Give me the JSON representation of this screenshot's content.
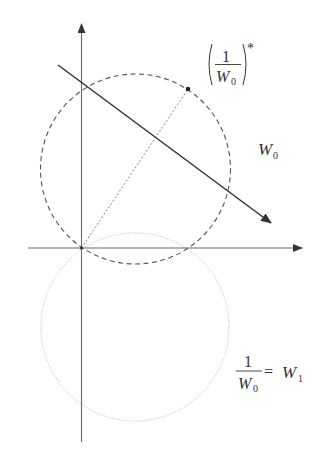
{
  "diagram": {
    "colors": {
      "axes": "#6a6a6a",
      "dashed_circle": "#555555",
      "dotted_circle": "#b8b8b8",
      "solid_line": "#333333",
      "dashed_line": "#777777",
      "text": "#333333"
    },
    "axes": {
      "origin": [
        81.5,
        248
      ],
      "x_axis": {
        "from": [
          28,
          248
        ],
        "to": [
          302,
          248
        ],
        "arrow": true
      },
      "y_axis": {
        "from": [
          81.5,
          442
        ],
        "to": [
          81.5,
          24
        ],
        "arrow": true
      }
    },
    "circles": [
      {
        "name": "W0",
        "style": "dashed",
        "center": [
          135.5,
          169
        ],
        "r": 95
      },
      {
        "name": "W1",
        "style": "dotted",
        "center": [
          135,
          327
        ],
        "r": 94
      }
    ],
    "lines": [
      {
        "name": "directed-line",
        "style": "solid",
        "from": [
          58,
          65
        ],
        "to": [
          271,
          223
        ],
        "arrow": true
      },
      {
        "name": "radius-line",
        "style": "dashed",
        "from": [
          81.5,
          248
        ],
        "to": [
          188,
          89
        ],
        "arrow": false
      }
    ],
    "points": [
      {
        "name": "conjugate-inverse-point",
        "at": [
          188,
          89
        ]
      }
    ],
    "labels": {
      "conjugate": {
        "numerator": "1",
        "denominator_base": "W",
        "denominator_sub": "0",
        "superscript": "*"
      },
      "w0": {
        "base": "W",
        "sub": "0"
      },
      "w1_eq": {
        "numerator": "1",
        "denominator_base": "W",
        "denominator_sub": "0",
        "equals": "=",
        "rhs_base": "W",
        "rhs_sub": "1"
      }
    }
  }
}
